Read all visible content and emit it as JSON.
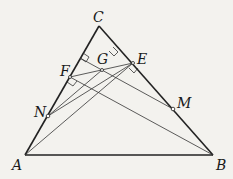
{
  "figure": {
    "type": "geometry",
    "background": "#f3f2ee",
    "points": {
      "A": {
        "label": "A",
        "x": 25,
        "y": 155
      },
      "B": {
        "label": "B",
        "x": 213,
        "y": 155
      },
      "C": {
        "label": "C",
        "x": 99,
        "y": 26
      },
      "E": {
        "label": "E",
        "x": 133,
        "y": 63
      },
      "F": {
        "label": "F",
        "x": 70,
        "y": 77
      },
      "G": {
        "label": "G",
        "x": 102,
        "y": 70
      },
      "N": {
        "label": "N",
        "x": 48,
        "y": 116
      },
      "M": {
        "label": "M",
        "x": 173,
        "y": 109
      }
    },
    "labels": {
      "A": "A",
      "B": "B",
      "C": "C",
      "E": "E",
      "F": "F",
      "G": "G",
      "N": "N",
      "M": "M"
    },
    "segments": [
      [
        "A",
        "B"
      ],
      [
        "B",
        "C"
      ],
      [
        "C",
        "A"
      ],
      [
        "A",
        "E"
      ],
      [
        "B",
        "F"
      ],
      [
        "F",
        "E"
      ],
      [
        "N",
        "E"
      ],
      [
        "F",
        "M"
      ],
      [
        "N",
        "G"
      ]
    ],
    "right_angles": [
      "E",
      "F",
      "G-foot-CA",
      "G-foot-CB"
    ]
  }
}
